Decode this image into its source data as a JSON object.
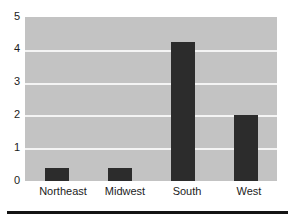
{
  "chart_data": {
    "type": "bar",
    "title": "",
    "subtitle": "",
    "xlabel": "",
    "ylabel": "",
    "categories": [
      "Northeast",
      "Midwest",
      "South",
      "West"
    ],
    "values": [
      0.4,
      0.4,
      4.25,
      2.0
    ],
    "series": [
      {
        "name": "",
        "values": [
          0.4,
          0.4,
          4.25,
          2.0
        ]
      }
    ],
    "ylim": [
      0,
      5
    ],
    "yticks": [
      0,
      1,
      2,
      3,
      4,
      5
    ],
    "ytick_labels": [
      "0",
      "1",
      "2",
      "3",
      "4",
      "5"
    ],
    "grid": true,
    "grid_axis": "y",
    "legend": false,
    "legend_position": "none",
    "bar_color": "#2c2c2c",
    "plot_background": "#c3c3c3",
    "gridline_color": "#f4f4f4",
    "figure_background": "#ffffff",
    "axis_text_color": "#1c1c1c",
    "bar_width_fraction": 0.38
  },
  "footer": {
    "rule_color": "#141414"
  },
  "axes": {
    "y_tick_0": "0",
    "y_tick_1": "1",
    "y_tick_2": "2",
    "y_tick_3": "3",
    "y_tick_4": "4",
    "y_tick_5": "5",
    "x_tick_0": "Northeast",
    "x_tick_1": "Midwest",
    "x_tick_2": "South",
    "x_tick_3": "West"
  }
}
